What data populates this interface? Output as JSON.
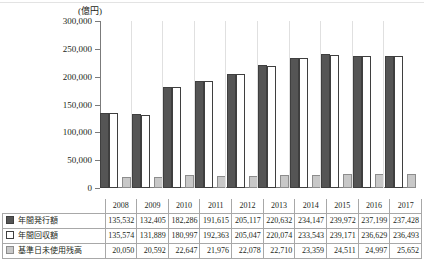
{
  "chart_data": {
    "type": "bar",
    "title": "",
    "unit_label": "(億円)",
    "xlabel": "",
    "ylabel": "",
    "ylim": [
      0,
      300000
    ],
    "yticks": [
      0,
      50000,
      100000,
      150000,
      200000,
      250000,
      300000
    ],
    "ytick_labels": [
      "0",
      "50,000",
      "100,000",
      "150,000",
      "200,000",
      "250,000",
      "300,000"
    ],
    "grid": false,
    "legend_position": "table-row-headers",
    "categories": [
      "2008",
      "2009",
      "2010",
      "2011",
      "2012",
      "2013",
      "2014",
      "2015",
      "2016",
      "2017"
    ],
    "series": [
      {
        "name": "年間発行額",
        "swatch": "issue",
        "color": "#555555",
        "values": [
          135532,
          132405,
          182286,
          191615,
          205117,
          220632,
          234147,
          239972,
          237199,
          237428
        ],
        "display": [
          "135,532",
          "132,405",
          "182,286",
          "191,615",
          "205,117",
          "220,632",
          "234,147",
          "239,972",
          "237,199",
          "237,428"
        ]
      },
      {
        "name": "年間回収額",
        "swatch": "collect",
        "color": "#ffffff",
        "values": [
          135574,
          131889,
          180997,
          192363,
          205047,
          220074,
          233543,
          239171,
          236629,
          236493
        ],
        "display": [
          "135,574",
          "131,889",
          "180,997",
          "192,363",
          "205,047",
          "220,074",
          "233,543",
          "239,171",
          "236,629",
          "236,493"
        ]
      },
      {
        "name": "基準日未使用残高",
        "swatch": "balance",
        "color": "#c8c8c8",
        "values": [
          20050,
          20592,
          22647,
          21976,
          22078,
          22710,
          23359,
          24511,
          24997,
          25652
        ],
        "display": [
          "20,050",
          "20,592",
          "22,647",
          "21,976",
          "22,078",
          "22,710",
          "23,359",
          "24,511",
          "24,997",
          "25,652"
        ]
      }
    ]
  }
}
